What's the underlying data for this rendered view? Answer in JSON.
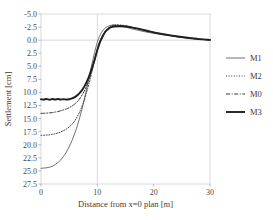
{
  "chart_data": {
    "type": "line",
    "title": "",
    "xlabel": "Distance from x=0 plan [m]",
    "ylabel": "Settlement [cm]",
    "xlim": [
      0,
      30
    ],
    "ylim": [
      -5.0,
      27.5
    ],
    "y_inverted": true,
    "grid": true,
    "gridlines": {
      "x": [
        10
      ],
      "y": [
        0.0
      ]
    },
    "legend_position": "right",
    "xticks": [
      "0",
      "10",
      "20",
      "30"
    ],
    "xtick_values": [
      0,
      10,
      20,
      30
    ],
    "yticks": [
      "-5.0",
      "-2.5",
      "0.0",
      "2.5",
      "5.0",
      "7.5",
      "10.0",
      "12.5",
      "15.0",
      "17.5",
      "20.0",
      "22.5",
      "25.0",
      "27.5"
    ],
    "ytick_values": [
      -5.0,
      -2.5,
      0.0,
      2.5,
      5.0,
      7.5,
      10.0,
      12.5,
      15.0,
      17.5,
      20.0,
      22.5,
      25.0,
      27.5
    ],
    "x": [
      0,
      0.5,
      1,
      1.5,
      2,
      2.5,
      3,
      3.5,
      4,
      4.5,
      5,
      5.5,
      6,
      6.5,
      7,
      7.5,
      8,
      8.5,
      9,
      9.5,
      10,
      10.5,
      11,
      11.5,
      12,
      12.5,
      13,
      14,
      15,
      16,
      17,
      18,
      19,
      20,
      22,
      24,
      26,
      28,
      30
    ],
    "series": [
      {
        "name": "M1",
        "style": "thin-solid",
        "color": "#4d4d4d",
        "width": 0.8,
        "dash": "none",
        "values": [
          24.5,
          24.45,
          24.4,
          24.3,
          24.1,
          23.8,
          23.4,
          22.9,
          22.2,
          21.4,
          20.4,
          19.2,
          17.8,
          16.2,
          14.3,
          12.2,
          9.8,
          7.3,
          4.8,
          2.4,
          0.4,
          -1.0,
          -1.9,
          -2.4,
          -2.7,
          -2.85,
          -2.9,
          -2.75,
          -2.5,
          -2.2,
          -1.95,
          -1.7,
          -1.5,
          -1.3,
          -0.95,
          -0.65,
          -0.4,
          -0.2,
          -0.05
        ]
      },
      {
        "name": "M2",
        "style": "dotted",
        "color": "#3a3a3a",
        "width": 1.0,
        "dash": "1,1.6",
        "values": [
          18.2,
          18.18,
          18.15,
          18.1,
          18.0,
          17.9,
          17.75,
          17.55,
          17.3,
          17.0,
          16.6,
          16.1,
          15.4,
          14.5,
          13.4,
          12.0,
          10.3,
          8.4,
          6.2,
          3.9,
          1.7,
          0.1,
          -1.1,
          -1.9,
          -2.45,
          -2.75,
          -2.9,
          -2.9,
          -2.75,
          -2.5,
          -2.2,
          -1.9,
          -1.65,
          -1.4,
          -1.0,
          -0.7,
          -0.42,
          -0.2,
          -0.05
        ]
      },
      {
        "name": "M0",
        "style": "dash-dot",
        "color": "#3a3a3a",
        "width": 1.0,
        "dash": "4,1.6,1,1.6",
        "values": [
          14.0,
          13.98,
          13.95,
          13.9,
          13.85,
          13.75,
          13.65,
          13.5,
          13.35,
          13.15,
          12.9,
          12.6,
          12.2,
          11.7,
          11.0,
          10.1,
          9.0,
          7.6,
          5.9,
          4.0,
          2.0,
          0.4,
          -0.8,
          -1.7,
          -2.3,
          -2.6,
          -2.75,
          -2.8,
          -2.7,
          -2.5,
          -2.25,
          -2.0,
          -1.75,
          -1.5,
          -1.1,
          -0.75,
          -0.45,
          -0.2,
          -0.05
        ]
      },
      {
        "name": "M3",
        "style": "thick-solid",
        "color": "#1f1f1f",
        "width": 1.9,
        "dash": "none",
        "values": [
          11.3,
          11.35,
          11.25,
          11.4,
          11.25,
          11.35,
          11.25,
          11.35,
          11.3,
          11.35,
          11.3,
          11.15,
          10.9,
          10.5,
          9.95,
          9.2,
          8.2,
          7.0,
          5.5,
          3.8,
          1.9,
          0.3,
          -0.85,
          -1.7,
          -2.2,
          -2.5,
          -2.6,
          -2.65,
          -2.6,
          -2.45,
          -2.25,
          -2.0,
          -1.75,
          -1.5,
          -1.1,
          -0.75,
          -0.45,
          -0.2,
          -0.05
        ]
      }
    ]
  },
  "legend": {
    "items": [
      {
        "label": "M1"
      },
      {
        "label": "M2"
      },
      {
        "label": "M0"
      },
      {
        "label": "M3"
      }
    ]
  }
}
